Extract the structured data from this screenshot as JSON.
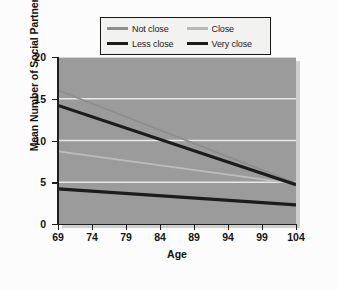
{
  "chart_data": {
    "type": "line",
    "title": "",
    "xlabel": "Age",
    "ylabel": "Mean Number of Social Partners",
    "xlim": [
      69,
      104
    ],
    "ylim": [
      0,
      20
    ],
    "xticks": [
      69,
      74,
      79,
      84,
      89,
      94,
      99,
      104
    ],
    "yticks": [
      0,
      5,
      10,
      15,
      20
    ],
    "grid": "horizontal",
    "gridlines_at": [
      5,
      10,
      15,
      20
    ],
    "legend_position": "above-plot",
    "plot_background": "#9b9b9b",
    "gridline_color": "#e8e8e8",
    "series": [
      {
        "name": "Not close",
        "color": "#8d8d8d",
        "width": 1.7,
        "x": [
          69,
          104
        ],
        "values": [
          16.0,
          4.9
        ]
      },
      {
        "name": "Close",
        "color": "#bdbdbd",
        "width": 1.9,
        "x": [
          69,
          104
        ],
        "values": [
          8.7,
          4.8
        ]
      },
      {
        "name": "Less close",
        "color": "#1c1c1c",
        "width": 3.2,
        "x": [
          69,
          104
        ],
        "values": [
          14.2,
          4.7
        ]
      },
      {
        "name": "Very close",
        "color": "#1c1c1c",
        "width": 3.2,
        "x": [
          69,
          104
        ],
        "values": [
          4.2,
          2.3
        ]
      }
    ]
  },
  "legend": {
    "items": [
      {
        "label": "Not close"
      },
      {
        "label": "Close"
      },
      {
        "label": "Less close"
      },
      {
        "label": "Very close"
      }
    ]
  },
  "axes": {
    "x_title": "Age",
    "y_title": "Mean Number of Social Partners",
    "x_tick_labels": [
      "69",
      "74",
      "79",
      "84",
      "89",
      "94",
      "99",
      "104"
    ],
    "y_tick_labels": [
      "0",
      "5",
      "10",
      "15",
      "20"
    ]
  }
}
